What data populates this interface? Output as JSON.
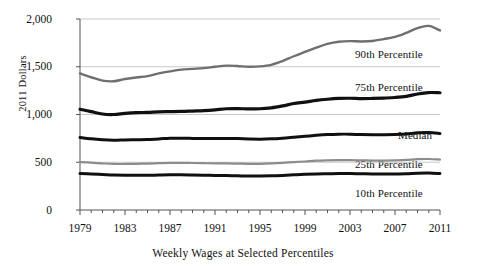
{
  "chart_data": {
    "type": "line",
    "title": "",
    "xlabel": "Weekly Wages at Selected Percentiles",
    "ylabel": "2011 Dollars",
    "grid": true,
    "legend_position": "inline-right",
    "xlim": [
      1979,
      2011
    ],
    "ylim": [
      0,
      2000
    ],
    "yticks": [
      0,
      500,
      1000,
      1500,
      2000
    ],
    "ytick_labels": [
      "0",
      "500",
      "1,000",
      "1,500",
      "2,000"
    ],
    "xticks": [
      1979,
      1983,
      1987,
      1991,
      1995,
      1999,
      2003,
      2007,
      2011
    ],
    "xtick_labels": [
      "1979",
      "1983",
      "1987",
      "1991",
      "1995",
      "1999",
      "2003",
      "2007",
      "2011"
    ],
    "x": [
      1979,
      1980,
      1981,
      1982,
      1983,
      1984,
      1985,
      1986,
      1987,
      1988,
      1989,
      1990,
      1991,
      1992,
      1993,
      1994,
      1995,
      1996,
      1997,
      1998,
      1999,
      2000,
      2001,
      2002,
      2003,
      2004,
      2005,
      2006,
      2007,
      2008,
      2009,
      2010,
      2011
    ],
    "series": [
      {
        "name": "90th Percentile",
        "color": "#6f6f6f",
        "width": 2.4,
        "label": "90th Percentile",
        "values": [
          1430,
          1390,
          1355,
          1348,
          1372,
          1388,
          1402,
          1430,
          1452,
          1470,
          1478,
          1486,
          1500,
          1512,
          1508,
          1500,
          1504,
          1520,
          1560,
          1610,
          1655,
          1700,
          1740,
          1762,
          1768,
          1765,
          1770,
          1790,
          1812,
          1855,
          1905,
          1928,
          1880
        ]
      },
      {
        "name": "75th Percentile",
        "color": "#101010",
        "width": 3.2,
        "label": "75th Percentile",
        "values": [
          1055,
          1030,
          1005,
          1000,
          1012,
          1020,
          1022,
          1028,
          1030,
          1032,
          1036,
          1040,
          1048,
          1060,
          1062,
          1058,
          1060,
          1070,
          1090,
          1115,
          1130,
          1148,
          1160,
          1168,
          1170,
          1166,
          1168,
          1172,
          1178,
          1190,
          1215,
          1230,
          1228
        ]
      },
      {
        "name": "Median",
        "color": "#101010",
        "width": 3.0,
        "label": "Median",
        "values": [
          760,
          745,
          735,
          730,
          734,
          736,
          738,
          744,
          752,
          752,
          750,
          748,
          748,
          750,
          748,
          744,
          742,
          745,
          752,
          762,
          772,
          782,
          790,
          794,
          794,
          790,
          788,
          788,
          790,
          796,
          808,
          812,
          800
        ]
      },
      {
        "name": "25th Percentile",
        "color": "#8c8c8c",
        "width": 2.2,
        "label": "25th Percentile",
        "values": [
          502,
          496,
          488,
          482,
          482,
          484,
          486,
          490,
          494,
          494,
          492,
          490,
          488,
          488,
          486,
          484,
          484,
          488,
          494,
          502,
          508,
          516,
          520,
          522,
          522,
          520,
          518,
          518,
          520,
          524,
          532,
          534,
          528
        ]
      },
      {
        "name": "10th Percentile",
        "color": "#101010",
        "width": 3.0,
        "label": "10th Percentile",
        "values": [
          382,
          378,
          372,
          366,
          364,
          364,
          364,
          366,
          368,
          368,
          366,
          364,
          362,
          360,
          358,
          356,
          356,
          358,
          362,
          368,
          374,
          378,
          380,
          382,
          382,
          380,
          378,
          378,
          378,
          380,
          386,
          388,
          382
        ]
      }
    ]
  },
  "labels": {
    "y_axis_title": "2011 Dollars",
    "x_axis_title": "Weekly Wages at Selected Percentiles",
    "s90": "90th Percentile",
    "s75": "75th Percentile",
    "median": "Median",
    "s25": "25th Percentile",
    "s10": "10th Percentile",
    "y0": "0",
    "y500": "500",
    "y1000": "1,000",
    "y1500": "1,500",
    "y2000": "2,000",
    "x1979": "1979",
    "x1983": "1983",
    "x1987": "1987",
    "x1991": "1991",
    "x1995": "1995",
    "x1999": "1999",
    "x2003": "2003",
    "x2007": "2007",
    "x2011": "2011"
  }
}
